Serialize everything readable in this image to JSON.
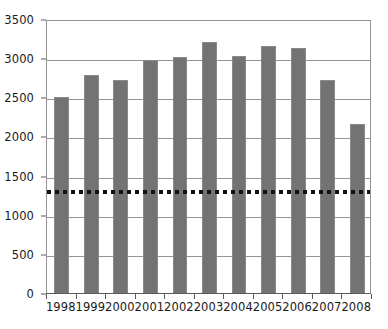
{
  "chart_data": {
    "type": "bar",
    "title": "",
    "subtitle": "",
    "xlabel": "",
    "ylabel": "",
    "categories": [
      "1998",
      "1999",
      "2000",
      "2001",
      "2002",
      "2003",
      "2004",
      "2005",
      "2006",
      "2007",
      "2008"
    ],
    "values": [
      2500,
      2790,
      2720,
      2980,
      3020,
      3210,
      3030,
      3150,
      3130,
      2720,
      2160
    ],
    "series": [
      {
        "name": "bars",
        "values": [
          2500,
          2790,
          2720,
          2980,
          3020,
          3210,
          3030,
          3150,
          3130,
          2720,
          2160
        ]
      }
    ],
    "ylim": [
      0,
      3500
    ],
    "yticks": [
      0,
      500,
      1000,
      1500,
      2000,
      2500,
      3000,
      3500
    ],
    "ytick_labels": [
      "0",
      "500",
      "1000",
      "1500",
      "2000",
      "2500",
      "3000",
      "3500"
    ],
    "grid": true,
    "legend": false,
    "legend_position": "none",
    "annotations": [
      {
        "name": "reference-line",
        "type": "horizontal-dotted-line",
        "value": 1320,
        "color": "#111111"
      }
    ],
    "colors": {
      "bar_fill": "#737373",
      "bar_stroke": "#8a8a8a",
      "gridline": "#949494",
      "axis": "#5a5a5a",
      "text": "#1a1a1a",
      "reference_line": "#111111",
      "background": "#ffffff"
    }
  }
}
